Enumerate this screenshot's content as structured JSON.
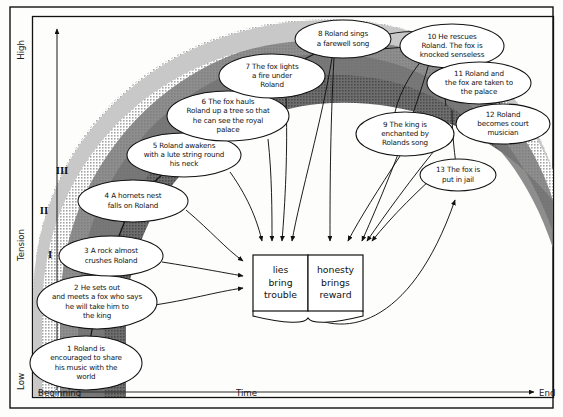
{
  "figure": {
    "border_color": "#111111",
    "band_outer_color": "#cfcfcf",
    "band_inner_color": "#7d7d7d",
    "node_fill": "#ffffff",
    "line_color": "#111111"
  },
  "axes": {
    "y": {
      "label": "Tension",
      "low": "Low",
      "high": "High"
    },
    "x": {
      "label": "Time",
      "start": "Beginning",
      "end": "End"
    },
    "bands": [
      {
        "numeral": "I",
        "x": 50,
        "y": 258
      },
      {
        "numeral": "II",
        "x": 44,
        "y": 214
      },
      {
        "numeral": "III",
        "x": 62,
        "y": 174
      }
    ]
  },
  "book": {
    "left_page": "lies\nbring\ntrouble",
    "left_lines": [
      "lies",
      "bring",
      "trouble"
    ],
    "right_page": "honesty\nbrings\nreward",
    "right_lines": [
      "honesty",
      "brings",
      "reward"
    ],
    "x": 253,
    "y": 255,
    "width": 110,
    "height": 56
  },
  "nodes": [
    {
      "id": 1,
      "label": "1  Roland is\nencouraged to share\nhis music with the\nworld",
      "lines": [
        "1  Roland is",
        "encouraged to share",
        "his music with the",
        "world"
      ],
      "cx": 86,
      "cy": 363,
      "rx": 56,
      "ry": 27
    },
    {
      "id": 2,
      "label": "2  He sets out\nand meets a fox who says\nhe will take him to\nthe king",
      "lines": [
        "2  He sets out",
        "and meets a fox who says",
        "he will take him to",
        "the king"
      ],
      "cx": 97,
      "cy": 302,
      "rx": 60,
      "ry": 27
    },
    {
      "id": 3,
      "label": "3 A rock almost\ncrushes Roland",
      "lines": [
        "3 A rock almost",
        "crushes Roland"
      ],
      "cx": 111,
      "cy": 256,
      "rx": 52,
      "ry": 20
    },
    {
      "id": 4,
      "label": "4 A hornets nest\nfalls on Roland",
      "lines": [
        "4 A hornets nest",
        "falls on Roland"
      ],
      "cx": 133,
      "cy": 201,
      "rx": 55,
      "ry": 21
    },
    {
      "id": 5,
      "label": "5  Roland awakens\nwith a lute string round\nhis neck",
      "lines": [
        "5  Roland awakens",
        "with a lute string round",
        "his neck"
      ],
      "cx": 184,
      "cy": 155,
      "rx": 57,
      "ry": 22
    },
    {
      "id": 6,
      "label": "6  The fox hauls\nRoland up a tree so that\nhe can see the royal\npalace",
      "lines": [
        "6  The fox hauls",
        "Roland up a tree so that",
        "he can see the royal",
        "palace"
      ],
      "cx": 228,
      "cy": 116,
      "rx": 61,
      "ry": 25
    },
    {
      "id": 7,
      "label": "7 The fox lights\na fire under\nRoland",
      "lines": [
        "7 The fox lights",
        "a fire under",
        "Roland"
      ],
      "cx": 272,
      "cy": 76,
      "rx": 53,
      "ry": 22
    },
    {
      "id": 8,
      "label": "8  Roland sings\na farewell song",
      "lines": [
        "8  Roland sings",
        "a farewell song"
      ],
      "cx": 343,
      "cy": 39,
      "rx": 48,
      "ry": 19
    },
    {
      "id": 9,
      "label": "9  The king is\nenchanted  by\nRolands song",
      "lines": [
        "9  The king is",
        "enchanted  by",
        "Rolands song"
      ],
      "cx": 405,
      "cy": 134,
      "rx": 49,
      "ry": 22
    },
    {
      "id": 10,
      "label": "10 He rescues\nRoland. The fox is\nknocked senseless",
      "lines": [
        "10 He rescues",
        "Roland. The fox is",
        "knocked senseless"
      ],
      "cx": 452,
      "cy": 46,
      "rx": 52,
      "ry": 22
    },
    {
      "id": 11,
      "label": "11  Roland and\nthe fox are taken to\nthe palace",
      "lines": [
        "11  Roland and",
        "the fox are taken to",
        "the palace"
      ],
      "cx": 479,
      "cy": 83,
      "rx": 52,
      "ry": 21
    },
    {
      "id": 12,
      "label": "12 Roland\nbecomes court\nmusician",
      "lines": [
        "12 Roland",
        "becomes court",
        "musician"
      ],
      "cx": 503,
      "cy": 124,
      "rx": 47,
      "ry": 20
    },
    {
      "id": 13,
      "label": "13 The fox is\nput in jail",
      "lines": [
        "13 The fox is",
        "put in jail"
      ],
      "cx": 458,
      "cy": 175,
      "rx": 38,
      "ry": 16
    }
  ]
}
